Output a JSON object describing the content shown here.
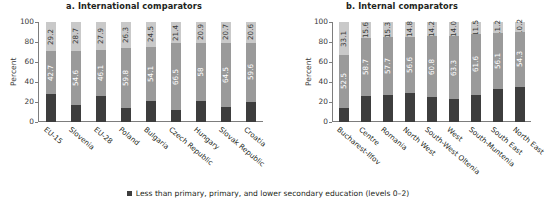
{
  "chart_data": [
    {
      "type": "bar",
      "title": "a. International comparators",
      "xlabel": "",
      "ylabel": "Percent",
      "ylim": [
        0,
        100
      ],
      "yticks": [
        "0",
        "20",
        "40",
        "60",
        "80",
        "100"
      ],
      "grid": false,
      "stacked": true,
      "categories": [
        "EU-15",
        "Slovenia",
        "EU-28",
        "Poland",
        "Bulgaria",
        "Czech Republic",
        "Hungary",
        "Slovak Republic",
        "Croatia"
      ],
      "series": [
        {
          "name": "Less than primary, primary, and lower secondary education (levels 0-2)",
          "values": [
            28.1,
            16.7,
            26.0,
            13.9,
            21.4,
            12.1,
            21.1,
            14.8,
            19.8
          ]
        },
        {
          "name": "Upper secondary and post-secondary non-tertiary education (levels 3-4)",
          "values": [
            42.7,
            54.6,
            46.1,
            59.8,
            54.1,
            66.5,
            58.0,
            64.5,
            59.6
          ]
        },
        {
          "name": "Tertiary education (levels 5-8)",
          "values": [
            29.2,
            28.7,
            27.9,
            26.3,
            24.5,
            21.4,
            20.9,
            20.7,
            20.6
          ]
        }
      ],
      "top_labels": [
        "29.2",
        "28.7",
        "27.9",
        "26.3",
        "24.5",
        "21.4",
        "20.9",
        "20.7",
        "20.6"
      ],
      "mid_labels": [
        "42.7",
        "54.6",
        "46.1",
        "59.8",
        "54.1",
        "66.5",
        "58",
        "64.5",
        "59.6"
      ]
    },
    {
      "type": "bar",
      "title": "b. Internal comparators",
      "xlabel": "",
      "ylabel": "Percent",
      "ylim": [
        0,
        100
      ],
      "yticks": [
        "0",
        "20",
        "40",
        "60",
        "80",
        "100"
      ],
      "grid": false,
      "stacked": true,
      "categories": [
        "Bucharest-Ilfov",
        "Centre",
        "Romania",
        "North West",
        "South-West Oltenia",
        "West",
        "South-Muntenia",
        "South East",
        "North East"
      ],
      "series": [
        {
          "name": "Less than primary, primary, and lower secondary education (levels 0-2)",
          "values": [
            14.4,
            25.7,
            27.0,
            28.6,
            25.0,
            22.7,
            26.9,
            32.7,
            35.5
          ]
        },
        {
          "name": "Upper secondary and post-secondary non-tertiary education (levels 3-4)",
          "values": [
            52.5,
            58.7,
            57.7,
            56.6,
            60.8,
            63.3,
            61.6,
            56.1,
            54.3
          ]
        },
        {
          "name": "Tertiary education (levels 5-8)",
          "values": [
            33.1,
            15.6,
            15.3,
            14.8,
            14.2,
            14.0,
            11.5,
            11.2,
            10.2
          ]
        }
      ],
      "top_labels": [
        "33.1",
        "15.6",
        "15.3",
        "14.8",
        "14.2",
        "14.0",
        "11.5",
        "11.2",
        "10.2"
      ],
      "mid_labels": [
        "52.5",
        "58.7",
        "57.7",
        "56.6",
        "60.8",
        "63.3",
        "61.6",
        "56.1",
        "54.3"
      ]
    }
  ],
  "legend": {
    "label": "Less than primary, primary, and lower secondary education (levels 0–2)",
    "swatch_color": "#3d3d3d"
  },
  "colors": {
    "segment_bottom": "#3d3d3d",
    "segment_middle": "#9a9a9a",
    "segment_top": "#c9c9c9",
    "axis": "#7d7d7d",
    "text": "#231f20"
  }
}
